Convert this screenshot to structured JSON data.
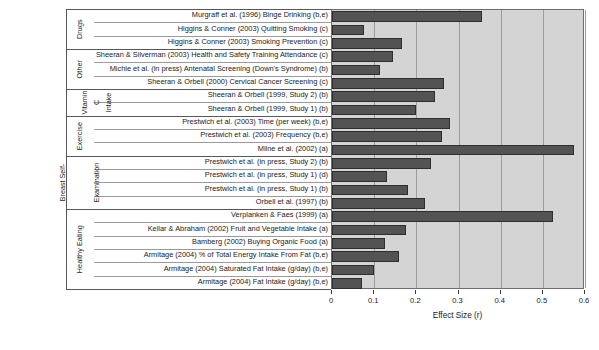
{
  "chart_data": {
    "type": "bar",
    "orientation": "horizontal",
    "title": "",
    "xlabel": "Effect Size (r)",
    "ylabel": "",
    "xlim": [
      0,
      0.6
    ],
    "xticks": [
      "0",
      "0.1",
      "0.2",
      "0.3",
      "0.4",
      "0.5",
      "0.6"
    ],
    "xtick_values": [
      0,
      0.1,
      0.2,
      0.3,
      0.4,
      0.5,
      0.6
    ],
    "grid": true,
    "legend": "none",
    "bar_color": "#535353",
    "plot_background": "#d4d4d4",
    "categories": [
      "Murgraff et al. (1996) Binge Drinking (b,e)",
      "Higgins & Conner (2003) Quitting Smoking (c)",
      "Higgins & Conner (2003) Smoking Prevention (c)",
      "Sheeran & Silverman (2003) Health and Safety Training Attendance (c)",
      "Michie et al. (in press) Antenatal Screening (Down's Syndrome) (b)",
      "Sheeran & Orbell (2000) Cervical Cancer Screening (c)",
      "Sheeran & Orbell (1999, Study 2) (b)",
      "Sheeran & Orbell (1999, Study 1) (b)",
      "Prestwich et al. (2003) Time (per week) (b,e)",
      "Prestwich et al. (2003) Frequency (b,e)",
      "Milne et al. (2002) (a)",
      "Prestwich et al. (in press, Study 2) (b)",
      "Prestwich et al. (in press, Study 1) (d)",
      "Prestwich et al. (in press, Study 1) (b)",
      "Orbell et al. (1997) (b)",
      "Verplanken & Faes (1999) (a)",
      "Kellar & Abraham (2002) Fruit and Vegetable Intake (a)",
      "Bamberg (2002) Buying Organic Food (a)",
      "Armitage (2004) % of Total Energy Intake From Fat (b,e)",
      "Armitage (2004) Saturated Fat Intake (g/day) (b,e)",
      "Armitage (2004) Fat Intake (g/day) (b,e)"
    ],
    "values": [
      0.355,
      0.075,
      0.165,
      0.145,
      0.115,
      0.265,
      0.245,
      0.2,
      0.28,
      0.26,
      0.575,
      0.235,
      0.13,
      0.18,
      0.22,
      0.525,
      0.175,
      0.125,
      0.16,
      0.1,
      0.07
    ],
    "groups": [
      {
        "name": "Drugs",
        "start_index": 0,
        "count": 3
      },
      {
        "name": "Other",
        "start_index": 3,
        "count": 3
      },
      {
        "name": "Vitamin C Intake",
        "start_index": 6,
        "count": 2,
        "name_parts": [
          "Vitamin",
          "C",
          "Intake"
        ]
      },
      {
        "name": "Exercise",
        "start_index": 8,
        "count": 3
      },
      {
        "name": "Breast Self-Examination",
        "start_index": 11,
        "count": 4,
        "name_parts": [
          "Breast Self-",
          "Examination"
        ]
      },
      {
        "name": "Healthy Eating",
        "start_index": 15,
        "count": 6
      }
    ]
  }
}
